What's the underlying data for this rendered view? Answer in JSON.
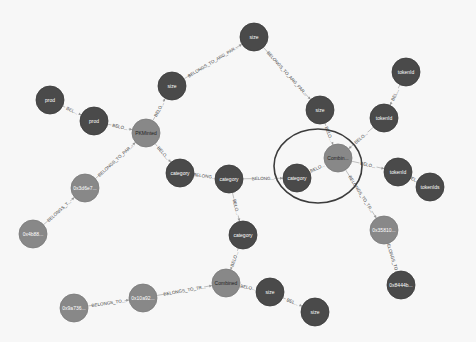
{
  "graph": {
    "background": "#f7f7f7",
    "colors": {
      "dark_node": "#4a4a4a",
      "light_node": "#888888",
      "selection_ring": "#3c3c3c",
      "edge": "#b0b0b0"
    },
    "selection": {
      "cx": 318,
      "cy": 166,
      "rx": 44,
      "ry": 37
    },
    "nodes": [
      {
        "id": "n_size_top",
        "label": "size",
        "x": 254,
        "y": 37,
        "r": 14,
        "kind": "dark"
      },
      {
        "id": "n_size_left",
        "label": "size",
        "x": 172,
        "y": 86,
        "r": 14,
        "kind": "dark"
      },
      {
        "id": "n_size_right",
        "label": "size",
        "x": 320,
        "y": 110,
        "r": 14,
        "kind": "dark"
      },
      {
        "id": "n_tokenid_top",
        "label": "tokenId",
        "x": 406,
        "y": 72,
        "r": 14,
        "kind": "dark"
      },
      {
        "id": "n_tokenid_mid",
        "label": "tokenId",
        "x": 384,
        "y": 118,
        "r": 14,
        "kind": "dark"
      },
      {
        "id": "n_prod1",
        "label": "prod",
        "x": 50,
        "y": 100,
        "r": 14,
        "kind": "dark"
      },
      {
        "id": "n_prod2",
        "label": "prod",
        "x": 94,
        "y": 121,
        "r": 14,
        "kind": "dark"
      },
      {
        "id": "n_pkminted",
        "label": "PKMinted",
        "x": 146,
        "y": 133,
        "r": 14,
        "kind": "light"
      },
      {
        "id": "n_cat_left",
        "label": "category",
        "x": 180,
        "y": 173,
        "r": 14,
        "kind": "dark"
      },
      {
        "id": "n_cat_center",
        "label": "category",
        "x": 229,
        "y": 179,
        "r": 14,
        "kind": "dark"
      },
      {
        "id": "n_cat_sel",
        "label": "category",
        "x": 297,
        "y": 178,
        "r": 14,
        "kind": "dark"
      },
      {
        "id": "n_combin_sel",
        "label": "Combin...",
        "x": 338,
        "y": 158,
        "r": 14,
        "kind": "light"
      },
      {
        "id": "n_tokenid_low",
        "label": "tokenId",
        "x": 398,
        "y": 172,
        "r": 14,
        "kind": "dark"
      },
      {
        "id": "n_tokenids",
        "label": "tokenIds",
        "x": 430,
        "y": 187,
        "r": 14,
        "kind": "dark"
      },
      {
        "id": "n_0x3d6",
        "label": "0x3d6e7...",
        "x": 85,
        "y": 188,
        "r": 14,
        "kind": "light"
      },
      {
        "id": "n_0x4b8",
        "label": "0x4b88...",
        "x": 33,
        "y": 234,
        "r": 14,
        "kind": "light"
      },
      {
        "id": "n_cat_bottom",
        "label": "category",
        "x": 243,
        "y": 235,
        "r": 14,
        "kind": "dark"
      },
      {
        "id": "n_0x358",
        "label": "0x35810...",
        "x": 384,
        "y": 230,
        "r": 14,
        "kind": "light"
      },
      {
        "id": "n_0x844",
        "label": "0x8444b...",
        "x": 401,
        "y": 285,
        "r": 14,
        "kind": "dark"
      },
      {
        "id": "n_combined",
        "label": "Combined",
        "x": 226,
        "y": 283,
        "r": 14,
        "kind": "light"
      },
      {
        "id": "n_size_b1",
        "label": "size",
        "x": 270,
        "y": 292,
        "r": 14,
        "kind": "dark"
      },
      {
        "id": "n_size_b2",
        "label": "size",
        "x": 315,
        "y": 312,
        "r": 14,
        "kind": "dark"
      },
      {
        "id": "n_0x10a",
        "label": "0x10a92...",
        "x": 143,
        "y": 298,
        "r": 14,
        "kind": "light"
      },
      {
        "id": "n_0x9a7",
        "label": "0x9a736...",
        "x": 74,
        "y": 308,
        "r": 14,
        "kind": "light"
      }
    ],
    "edges": [
      {
        "from": "n_size_left",
        "to": "n_size_top",
        "label": "BELONGS_TO_ARG_PAR..."
      },
      {
        "from": "n_size_top",
        "to": "n_size_right",
        "label": "BELONGS_TO_ARG_PAR..."
      },
      {
        "from": "n_pkminted",
        "to": "n_size_left",
        "label": "BELO..."
      },
      {
        "from": "n_prod1",
        "to": "n_prod2",
        "label": "BEL..."
      },
      {
        "from": "n_prod2",
        "to": "n_pkminted",
        "label": "BELO..."
      },
      {
        "from": "n_pkminted",
        "to": "n_cat_left",
        "label": "BELO..."
      },
      {
        "from": "n_0x3d6",
        "to": "n_pkminted",
        "label": "BELONGS_TO_PAR..."
      },
      {
        "from": "n_0x4b8",
        "to": "n_0x3d6",
        "label": "BELONGS_T..."
      },
      {
        "from": "n_cat_left",
        "to": "n_cat_center",
        "label": "BELONG..."
      },
      {
        "from": "n_cat_center",
        "to": "n_cat_sel",
        "label": "BELONG..."
      },
      {
        "from": "n_cat_sel",
        "to": "n_combin_sel",
        "label": "BELO..."
      },
      {
        "from": "n_size_right",
        "to": "n_combin_sel",
        "label": "BELO..."
      },
      {
        "from": "n_tokenid_mid",
        "to": "n_combin_sel",
        "label": "BELO..."
      },
      {
        "from": "n_tokenid_top",
        "to": "n_tokenid_mid",
        "label": "BEL..."
      },
      {
        "from": "n_combin_sel",
        "to": "n_tokenid_low",
        "label": "BELO..."
      },
      {
        "from": "n_tokenid_low",
        "to": "n_tokenids",
        "label": "BEL..."
      },
      {
        "from": "n_combin_sel",
        "to": "n_0x358",
        "label": "BELONGS_TO_TR..."
      },
      {
        "from": "n_0x358",
        "to": "n_0x844",
        "label": "BELONGS_TO..."
      },
      {
        "from": "n_cat_center",
        "to": "n_cat_bottom",
        "label": "BELO..."
      },
      {
        "from": "n_cat_bottom",
        "to": "n_combined",
        "label": "BELO..."
      },
      {
        "from": "n_combined",
        "to": "n_size_b1",
        "label": "BELO..."
      },
      {
        "from": "n_size_b1",
        "to": "n_size_b2",
        "label": "BEL..."
      },
      {
        "from": "n_0x10a",
        "to": "n_combined",
        "label": "BELONGS_TO_TR..."
      },
      {
        "from": "n_0x9a7",
        "to": "n_0x10a",
        "label": "BELONGS_TO..."
      }
    ]
  }
}
